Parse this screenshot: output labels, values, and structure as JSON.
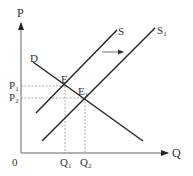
{
  "diagram": {
    "type": "supply-demand",
    "axes": {
      "y_label": "P",
      "x_label": "Q",
      "origin_label": "0"
    },
    "curves": [
      {
        "id": "D",
        "label": "D",
        "kind": "demand"
      },
      {
        "id": "S",
        "label": "S",
        "kind": "supply"
      },
      {
        "id": "S1",
        "label": "S",
        "subscript": "1",
        "kind": "supply-shifted"
      }
    ],
    "equilibria": [
      {
        "label": "E",
        "subscript": "",
        "price": "P1",
        "quantity": "Q1"
      },
      {
        "label": "E",
        "subscript": "1",
        "price": "P2",
        "quantity": "Q2"
      }
    ],
    "price_ticks": [
      {
        "label": "P",
        "subscript": "1"
      },
      {
        "label": "P",
        "subscript": "2"
      }
    ],
    "quantity_ticks": [
      {
        "label": "Q",
        "subscript": "1"
      },
      {
        "label": "Q",
        "subscript": "2"
      }
    ],
    "shift_arrow": {
      "direction": "right",
      "meaning": "supply increases from S to S1"
    },
    "colors": {
      "line": "#222222",
      "axis": "#555555",
      "guide": "#888888",
      "text": "#333333"
    }
  }
}
